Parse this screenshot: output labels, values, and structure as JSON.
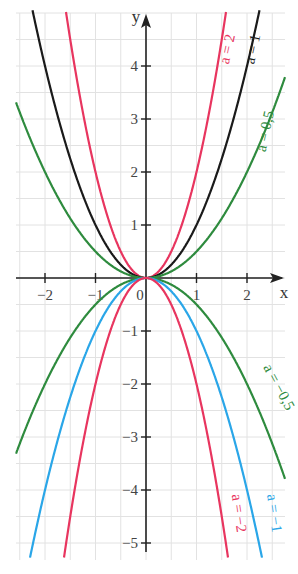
{
  "chart_data": {
    "type": "line",
    "title": "",
    "xlabel": "x",
    "ylabel": "y",
    "xlim": [
      -2.6,
      2.75
    ],
    "ylim": [
      -5.2,
      5.0
    ],
    "grid": true,
    "grid_step": 0.5,
    "x_ticks": [
      -2,
      -1,
      0,
      1,
      2
    ],
    "x_tick_labels": [
      "−2",
      "−1",
      "0",
      "1",
      "2"
    ],
    "y_ticks": [
      -5,
      -4,
      -3,
      -2,
      -1,
      1,
      2,
      3,
      4
    ],
    "y_tick_labels": [
      "−5",
      "−4",
      "−3",
      "−2",
      "−1",
      "1",
      "2",
      "3",
      "4"
    ],
    "function": "y = a·x²",
    "series": [
      {
        "name": "a = 2",
        "a": 2,
        "color": "#e8355f",
        "label_pos": [
          1.7,
          4.3
        ]
      },
      {
        "name": "a = 1",
        "a": 1,
        "color": "#1a1a1a",
        "label_pos": [
          2.2,
          4.3
        ]
      },
      {
        "name": "a = 0,5",
        "a": 0.5,
        "color": "#2e8b3e",
        "label_pos": [
          2.45,
          2.75
        ]
      },
      {
        "name": "a = −0,5",
        "a": -0.5,
        "color": "#2e8b3e",
        "label_pos": [
          2.55,
          -2.1
        ]
      },
      {
        "name": "a = −1",
        "a": -1,
        "color": "#2aa6e8",
        "label_pos": [
          2.45,
          -4.45
        ]
      },
      {
        "name": "a = −2",
        "a": -2,
        "color": "#e8355f",
        "label_pos": [
          1.75,
          -4.45
        ]
      }
    ]
  },
  "colors": {
    "axis": "#222222",
    "grid": "#e2e2e2",
    "background": "#ffffff"
  }
}
